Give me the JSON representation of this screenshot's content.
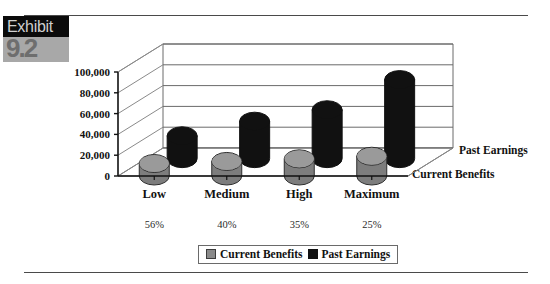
{
  "exhibit": {
    "word": "Exhibit",
    "number": "9.2"
  },
  "legend": {
    "items": [
      {
        "label": "Current Benefits",
        "color": "#8a8a8a",
        "swatch": "gray"
      },
      {
        "label": "Past Earnings",
        "color": "#111111",
        "swatch": "black"
      }
    ]
  },
  "series_labels": {
    "back": "Past Earnings",
    "front": "Current Benefits"
  },
  "chart_data": {
    "type": "bar",
    "title": "",
    "xlabel": "",
    "ylabel": "",
    "categories": [
      "Low",
      "Medium",
      "High",
      "Maximum"
    ],
    "annotations": [
      "56%",
      "40%",
      "35%",
      "25%"
    ],
    "series": [
      {
        "name": "Current Benefits",
        "color": "#8a8a8a",
        "values": [
          12000,
          14000,
          16500,
          19000
        ]
      },
      {
        "name": "Past Earnings",
        "color": "#111111",
        "values": [
          22000,
          36000,
          47000,
          76000
        ]
      }
    ],
    "yticks": [
      "0",
      "20,000",
      "40,000",
      "60,000",
      "80,000",
      "100,000"
    ],
    "ytick_values": [
      0,
      20000,
      40000,
      60000,
      80000,
      100000
    ],
    "ylim": [
      0,
      100000
    ],
    "grid": true,
    "legend_position": "bottom",
    "projection": "3d-cylinder"
  }
}
